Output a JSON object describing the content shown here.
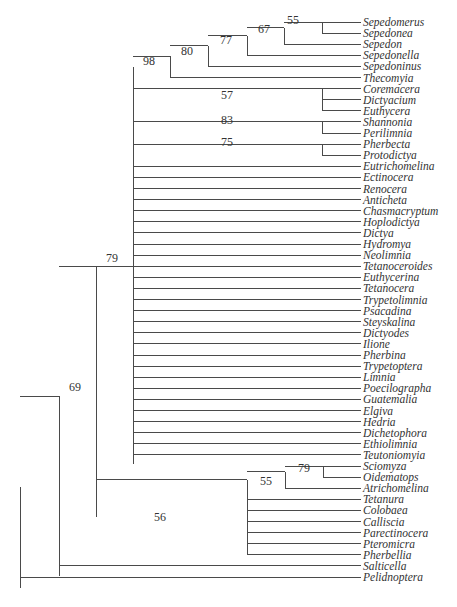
{
  "diagram": {
    "type": "phylogenetic-tree",
    "colors": {
      "line": "#4a4a4a",
      "text": "#333333",
      "background": "#ffffff"
    },
    "layout": {
      "leaf_x_end": 361,
      "label_x": 363,
      "first_leaf_y": 22,
      "leaf_spacing": 11.1
    },
    "leaves": [
      "Sepedomerus",
      "Sepedonea",
      "Sepedon",
      "Sepedonella",
      "Sepedoninus",
      "Thecomyia",
      "Coremacera",
      "Dictyacium",
      "Euthycera",
      "Shannonia",
      "Perilimnia",
      "Pherbecta",
      "Protodictya",
      "Eutrichomelina",
      "Ectinocera",
      "Renocera",
      "Anticheta",
      "Chasmacryptum",
      "Hoplodictya",
      "Dictya",
      "Hydromya",
      "Neolimnia",
      "Tetanoceroides",
      "Euthycerina",
      "Tetanocera",
      "Trypetolimnia",
      "Psacadina",
      "Steyskalina",
      "Dictyodes",
      "Ilione",
      "Pherbina",
      "Trypetoptera",
      "Limnia",
      "Poecilographa",
      "Guatemalia",
      "Elgiva",
      "Hedria",
      "Dichetophora",
      "Ethiolimnia",
      "Teutoniomyia",
      "Sciomyza",
      "Oidematops",
      "Atrichomelina",
      "Tetanura",
      "Colobaea",
      "Calliscia",
      "Parectinocera",
      "Pteromicra",
      "Pherbellia",
      "Salticella",
      "Pelidnoptera"
    ],
    "leaf_parent_x": [
      322,
      322,
      284,
      247,
      208,
      170,
      322,
      322,
      322,
      322,
      322,
      322,
      322,
      133,
      133,
      133,
      133,
      133,
      133,
      133,
      133,
      133,
      133,
      133,
      133,
      133,
      133,
      133,
      133,
      133,
      133,
      133,
      133,
      133,
      133,
      133,
      133,
      133,
      133,
      133,
      323,
      323,
      285,
      247,
      247,
      247,
      247,
      247,
      247,
      59,
      20
    ],
    "internal_nodes": [
      {
        "id": "n55a",
        "x": 322,
        "y1": 22,
        "y2": 33,
        "parent_x": 284,
        "support": ""
      },
      {
        "id": "n55b",
        "x": 284,
        "y1": 27.5,
        "y2": 44.2,
        "parent_x": 247,
        "support": "55",
        "label_x": 293,
        "label_y": 24
      },
      {
        "id": "n67",
        "x": 247,
        "y1": 35.9,
        "y2": 55.3,
        "parent_x": 208,
        "support": "67",
        "label_x": 264,
        "label_y": 33
      },
      {
        "id": "n77",
        "x": 208,
        "y1": 45.6,
        "y2": 66.4,
        "parent_x": 170,
        "support": "77",
        "label_x": 226,
        "label_y": 44
      },
      {
        "id": "n80",
        "x": 170,
        "y1": 56,
        "y2": 77.5,
        "parent_x": 133,
        "support": "80",
        "label_x": 187,
        "label_y": 55
      },
      {
        "id": "n98",
        "x": 133,
        "y1": 66.8,
        "y2": 464,
        "parent_x": 96,
        "support": "98",
        "label_x": 149,
        "label_y": 65,
        "attach_y": 266
      },
      {
        "id": "n57",
        "x": 322,
        "y1": 88.6,
        "y2": 110.8,
        "parent_x": 133,
        "support": "57",
        "label_x": 227,
        "label_y": 99
      },
      {
        "id": "n83",
        "x": 322,
        "y1": 121.9,
        "y2": 133,
        "parent_x": 133,
        "support": "83",
        "label_x": 227,
        "label_y": 124
      },
      {
        "id": "n75",
        "x": 322,
        "y1": 144.1,
        "y2": 155.2,
        "parent_x": 133,
        "support": "75",
        "label_x": 227,
        "label_y": 146
      },
      {
        "id": "n79b",
        "x": 323,
        "y1": 466,
        "y2": 477.1,
        "parent_x": 285,
        "support": "79",
        "label_x": 304,
        "label_y": 472
      },
      {
        "id": "n55c",
        "x": 285,
        "y1": 471.6,
        "y2": 488.2,
        "parent_x": 247,
        "support": "55",
        "label_x": 266,
        "label_y": 485
      },
      {
        "id": "n56",
        "x": 247,
        "y1": 479.9,
        "y2": 554.5,
        "parent_x": 96,
        "support": "56",
        "label_x": 160,
        "label_y": 521
      },
      {
        "id": "n79a",
        "x": 96,
        "y1": 266,
        "y2": 517.2,
        "parent_x": 59,
        "support": "79",
        "label_x": 112,
        "label_y": 262
      },
      {
        "id": "n69",
        "x": 59,
        "y1": 396,
        "y2": 576,
        "parent_x": 20,
        "support": "69",
        "label_x": 75,
        "label_y": 391
      },
      {
        "id": "root",
        "x": 20,
        "y1": 487,
        "y2": 588,
        "parent_x": null,
        "support": ""
      }
    ]
  }
}
